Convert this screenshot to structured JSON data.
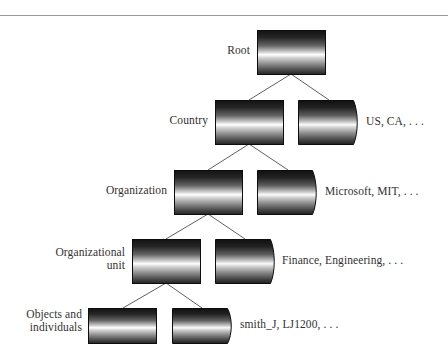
{
  "figure": {
    "background_color": "#ffffff",
    "rule_color": "#9a9a9a",
    "text_color": "#333132",
    "cylinder_dark": "#1a1a1a",
    "cylinder_mid": "#7d7d7d",
    "cylinder_highlight": "#ffffff",
    "cylinder_outline": "#111111"
  },
  "levels": [
    {
      "id": "root",
      "left_label": "Root",
      "right_label": "",
      "nodes": 1
    },
    {
      "id": "country",
      "left_label": "Country",
      "right_label": "US, CA, . . .",
      "nodes": 2
    },
    {
      "id": "organization",
      "left_label": "Organization",
      "right_label": "Microsoft, MIT, . . .",
      "nodes": 2
    },
    {
      "id": "organizational-unit",
      "left_label": "Organizational\nunit",
      "right_label": "Finance, Engineering, . . .",
      "nodes": 2
    },
    {
      "id": "objects-and-individuals",
      "left_label": "Objects and\nindividuals",
      "right_label": "smith_J, LJ1200, . . .",
      "nodes": 2
    }
  ],
  "nodes": {
    "root_1": {
      "name": "root-node"
    },
    "country_1": {
      "name": "country-node-primary"
    },
    "country_2": {
      "name": "country-node-secondary"
    },
    "org_1": {
      "name": "organization-node-primary"
    },
    "org_2": {
      "name": "organization-node-secondary"
    },
    "ou_1": {
      "name": "organizational-unit-node-primary"
    },
    "ou_2": {
      "name": "organizational-unit-node-secondary"
    },
    "obj_1": {
      "name": "objects-node-primary"
    },
    "obj_2": {
      "name": "objects-node-secondary"
    }
  }
}
